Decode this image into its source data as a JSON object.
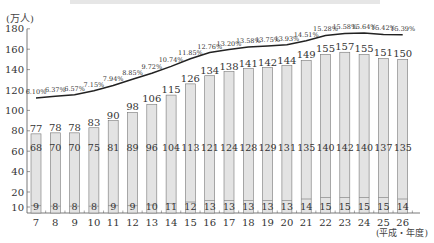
{
  "chart_data": {
    "type": "bar",
    "title": "",
    "xlabel": "(平成・年度)",
    "ylabel": "(万人)",
    "ylim": [
      0,
      180
    ],
    "yticks": [
      10,
      20,
      40,
      60,
      80,
      100,
      120,
      140,
      160,
      180
    ],
    "categories": [
      "7",
      "8",
      "9",
      "10",
      "11",
      "12",
      "13",
      "14",
      "15",
      "16",
      "17",
      "18",
      "19",
      "20",
      "21",
      "22",
      "23",
      "24",
      "25",
      "26"
    ],
    "series": [
      {
        "name": "total",
        "values": [
          77,
          78,
          78,
          83,
          90,
          98,
          106,
          115,
          126,
          134,
          138,
          141,
          142,
          144,
          149,
          155,
          157,
          155,
          151,
          150
        ]
      },
      {
        "name": "upper_segment",
        "values": [
          68,
          70,
          70,
          75,
          81,
          89,
          96,
          104,
          113,
          121,
          124,
          128,
          129,
          131,
          135,
          140,
          142,
          140,
          137,
          135
        ]
      },
      {
        "name": "lower_segment",
        "values": [
          9,
          8,
          8,
          8,
          9,
          9,
          10,
          11,
          12,
          13,
          13,
          13,
          13,
          13,
          14,
          15,
          15,
          15,
          15,
          14
        ]
      },
      {
        "name": "ratio_line",
        "type": "line",
        "labels": [
          "6.10%",
          "6.37%",
          "6.57%",
          "7.15%",
          "7.94%",
          "8.85%",
          "9.72%",
          "10.74%",
          "11.85%",
          "12.76%",
          "13.20%",
          "13.58%",
          "13.75%",
          "13.93%",
          "14.51%",
          "15.28%",
          "15.58%",
          "15.64%",
          "15.42%",
          "15.39%"
        ],
        "values": [
          6.1,
          6.37,
          6.57,
          7.15,
          7.94,
          8.85,
          9.72,
          10.74,
          11.85,
          12.76,
          13.2,
          13.58,
          13.75,
          13.93,
          14.51,
          15.28,
          15.58,
          15.64,
          15.42,
          15.39
        ]
      }
    ],
    "grid": false,
    "legend": "none"
  },
  "axis": {
    "y_unit": "(万人)",
    "x_unit": "(平成・年度)"
  },
  "colors": {
    "bar_fill": "#e3e3e3",
    "bar_stroke": "#777777",
    "line": "#222222",
    "text": "#333333"
  }
}
